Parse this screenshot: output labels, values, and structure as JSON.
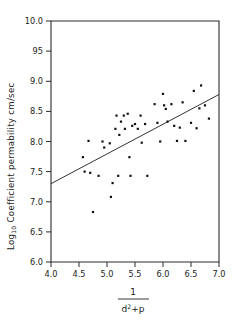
{
  "chart_data": {
    "type": "scatter",
    "title": "",
    "xlabel": "1 / (d^2 + p)",
    "xlabel_numerator": "1",
    "xlabel_denominator_base": "d",
    "xlabel_denominator_sup": "2",
    "xlabel_denominator_rest": "+p",
    "ylabel_main": "Log",
    "ylabel_sub": "10",
    "ylabel_rest": " Coefficient permability cm/sec",
    "ylabel": "Log10 Coefficient permability cm/sec",
    "xlim": [
      4.0,
      7.0
    ],
    "ylim": [
      6.0,
      10.0
    ],
    "xticks": [
      "4.0",
      "4.5",
      "5.0",
      "5.5",
      "6.0",
      "6.5",
      "7.0"
    ],
    "xtick_values": [
      4.0,
      4.5,
      5.0,
      5.5,
      6.0,
      6.5,
      7.0
    ],
    "yticks": [
      "10.0",
      "95",
      "9.0",
      "8.5",
      "8.0",
      "7.5",
      "7.0",
      "6.5",
      "6.0"
    ],
    "ytick_values": [
      10.0,
      9.5,
      9.0,
      8.5,
      8.0,
      7.5,
      7.0,
      6.5,
      6.0
    ],
    "grid": false,
    "legend": false,
    "marker": "square-dot",
    "marker_color": "#111111",
    "fit_line": {
      "label": "regression line",
      "x": [
        4.0,
        7.0
      ],
      "y": [
        7.3,
        8.78
      ],
      "color": "#333333"
    },
    "points": [
      [
        4.57,
        7.74
      ],
      [
        4.6,
        7.5
      ],
      [
        4.67,
        8.01
      ],
      [
        4.7,
        7.48
      ],
      [
        4.75,
        6.83
      ],
      [
        4.85,
        7.43
      ],
      [
        4.92,
        8.0
      ],
      [
        4.95,
        7.9
      ],
      [
        5.05,
        7.97
      ],
      [
        5.07,
        7.08
      ],
      [
        5.1,
        7.31
      ],
      [
        5.15,
        8.21
      ],
      [
        5.17,
        8.43
      ],
      [
        5.2,
        7.43
      ],
      [
        5.22,
        8.11
      ],
      [
        5.25,
        8.33
      ],
      [
        5.3,
        8.43
      ],
      [
        5.32,
        8.21
      ],
      [
        5.37,
        8.46
      ],
      [
        5.4,
        7.74
      ],
      [
        5.42,
        7.43
      ],
      [
        5.45,
        8.26
      ],
      [
        5.5,
        8.29
      ],
      [
        5.55,
        8.21
      ],
      [
        5.6,
        8.43
      ],
      [
        5.62,
        7.98
      ],
      [
        5.68,
        8.29
      ],
      [
        5.72,
        7.43
      ],
      [
        5.85,
        8.62
      ],
      [
        5.9,
        8.31
      ],
      [
        5.95,
        8.0
      ],
      [
        6.0,
        8.79
      ],
      [
        6.02,
        8.6
      ],
      [
        6.05,
        8.54
      ],
      [
        6.08,
        8.33
      ],
      [
        6.15,
        8.62
      ],
      [
        6.2,
        8.26
      ],
      [
        6.25,
        8.01
      ],
      [
        6.3,
        8.23
      ],
      [
        6.35,
        8.65
      ],
      [
        6.4,
        8.01
      ],
      [
        6.5,
        8.31
      ],
      [
        6.55,
        8.84
      ],
      [
        6.6,
        8.22
      ],
      [
        6.65,
        8.55
      ],
      [
        6.68,
        8.93
      ],
      [
        6.75,
        8.6
      ],
      [
        6.82,
        8.38
      ]
    ]
  }
}
